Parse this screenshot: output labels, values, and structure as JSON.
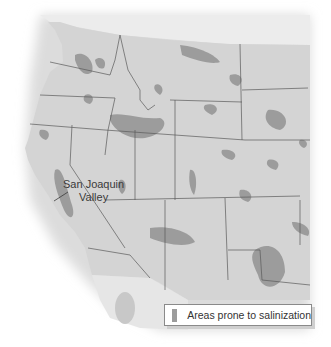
{
  "map": {
    "title": "",
    "region": "Western United States",
    "colors": {
      "land": "#d4d4d4",
      "salinization": "#9c9c9c",
      "border": "#5a5a5a",
      "outside": "#e8e8e8",
      "background": "#ffffff"
    },
    "labels": [
      {
        "text_line1": "San Joaquin",
        "text_line2": "Valley"
      }
    ],
    "legend": {
      "items": [
        {
          "label": "Areas prone to salinization",
          "color": "#9c9c9c"
        }
      ]
    }
  }
}
